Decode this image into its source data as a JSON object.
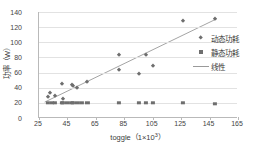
{
  "chart_data": {
    "type": "scatter",
    "title": "",
    "xlabel": "toggle（1×10³）",
    "ylabel": "功率（W）",
    "xlim": [
      25,
      165
    ],
    "ylim": [
      0,
      140
    ],
    "xticks": [
      25,
      45,
      65,
      85,
      105,
      125,
      145,
      165
    ],
    "yticks": [
      0,
      20,
      40,
      60,
      80,
      100,
      120,
      140
    ],
    "grid": true,
    "legend_position": "right",
    "series": [
      {
        "name": "动态功耗",
        "marker": "diamond",
        "color": "#6e6e6e",
        "points": [
          [
            31,
            28
          ],
          [
            33,
            33
          ],
          [
            36,
            29
          ],
          [
            41,
            45
          ],
          [
            42,
            25
          ],
          [
            48,
            43
          ],
          [
            49,
            42
          ],
          [
            52,
            39
          ],
          [
            59,
            47
          ],
          [
            81,
            83
          ],
          [
            81,
            64
          ],
          [
            95,
            58
          ],
          [
            100,
            83
          ],
          [
            105,
            69
          ],
          [
            126,
            128
          ],
          [
            149,
            131
          ]
        ]
      },
      {
        "name": "静态功耗",
        "marker": "square",
        "color": "#6e6e6e",
        "points": [
          [
            31,
            20
          ],
          [
            34,
            20
          ],
          [
            36,
            20
          ],
          [
            41,
            20
          ],
          [
            42,
            20
          ],
          [
            45,
            20
          ],
          [
            48,
            20
          ],
          [
            49,
            20
          ],
          [
            52,
            20
          ],
          [
            55,
            20
          ],
          [
            59,
            20
          ],
          [
            81,
            20
          ],
          [
            95,
            20
          ],
          [
            100,
            20
          ],
          [
            105,
            20
          ],
          [
            126,
            20
          ],
          [
            149,
            19
          ]
        ]
      },
      {
        "name": "线性",
        "marker": "line",
        "color": "#9a9a9a",
        "endpoints": [
          [
            29,
            21
          ],
          [
            150,
            131
          ]
        ]
      }
    ]
  },
  "legend": {
    "items": [
      {
        "label": "动态功耗",
        "key": "diamond-marker-icon"
      },
      {
        "label": "静态功耗",
        "key": "square-marker-icon"
      },
      {
        "label": "线性",
        "key": "line-marker-icon"
      }
    ]
  }
}
